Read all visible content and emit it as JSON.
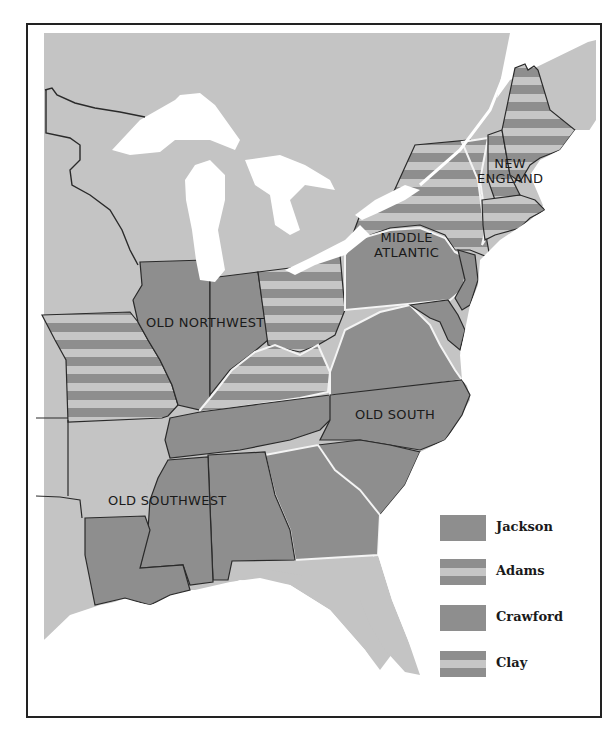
{
  "map": {
    "title": "",
    "regions": [
      {
        "id": "new-england",
        "label": "NEW\nENGLAND",
        "line1": "NEW",
        "line2": "ENGLAND",
        "winner": "Adams"
      },
      {
        "id": "middle-atlantic",
        "label": "MIDDLE ATLANTIC",
        "line1": "MIDDLE",
        "line2": "ATLANTIC",
        "winner": "Jackson"
      },
      {
        "id": "old-northwest",
        "label": "OLD NORTHWEST",
        "line1": "OLD NORTHWEST",
        "winner": "Jackson / Clay"
      },
      {
        "id": "old-south",
        "label": "OLD SOUTH",
        "line1": "OLD SOUTH",
        "winner": "Jackson / Crawford"
      },
      {
        "id": "old-southwest",
        "label": "OLD SOUTHWEST",
        "line1": "OLD SOUTHWEST",
        "winner": "Jackson"
      }
    ],
    "colors": {
      "land": "#c4c4c4",
      "solid_fill": "#8e8e8e",
      "stripe_dark": "#8e8e8e",
      "stripe_light": "#c6c6c6",
      "water": "#ffffff",
      "border": "#2a2a2a",
      "region_border": "#f4f4f4"
    }
  },
  "legend": {
    "items": [
      {
        "label": "Jackson",
        "pattern": "solid"
      },
      {
        "label": "Adams",
        "pattern": "striped"
      },
      {
        "label": "Crawford",
        "pattern": "solid"
      },
      {
        "label": "Clay",
        "pattern": "striped"
      }
    ]
  }
}
